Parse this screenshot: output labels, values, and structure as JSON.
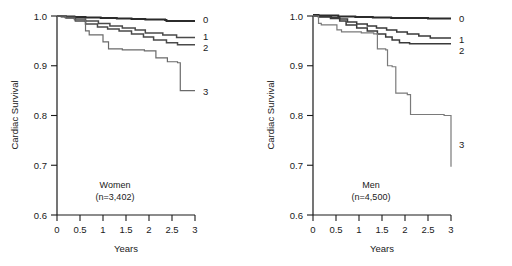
{
  "figure": {
    "title": "",
    "panel_count": 2
  },
  "chart_data": [
    {
      "type": "line",
      "title": "Women",
      "subtitle": "(n=3,402)",
      "xlabel": "Years",
      "ylabel": "Cardiac Survival",
      "xlim": [
        0,
        3
      ],
      "ylim": [
        0.6,
        1.0
      ],
      "xticks": [
        0,
        0.5,
        1,
        1.5,
        2,
        2.5,
        3
      ],
      "xticklabels": [
        "0",
        "0.5",
        "1",
        "1.5",
        "2",
        "2.5",
        "3"
      ],
      "yticks": [
        0.6,
        0.7,
        0.8,
        0.9,
        1.0
      ],
      "yticklabels": [
        "0.6",
        "0.7",
        "0.8",
        "0.9",
        "1.0"
      ],
      "grid": false,
      "legend_position": "right-of-curve-ends",
      "step_type": "post",
      "series": [
        {
          "name": "0",
          "label": "0",
          "color": "#2b2b2b",
          "width": 1.9,
          "x": [
            0.0,
            0.1,
            0.38,
            0.62,
            0.95,
            1.3,
            1.62,
            1.92,
            2.35,
            2.38,
            3.0
          ],
          "y": [
            1.0,
            0.999,
            0.998,
            0.997,
            0.996,
            0.995,
            0.994,
            0.993,
            0.992,
            0.99,
            0.99
          ]
        },
        {
          "name": "1",
          "label": "1",
          "color": "#4a4a4a",
          "width": 1.5,
          "x": [
            0.0,
            0.18,
            0.38,
            0.62,
            0.9,
            1.15,
            1.42,
            1.7,
            1.92,
            2.3,
            2.6,
            3.0
          ],
          "y": [
            1.0,
            0.998,
            0.994,
            0.99,
            0.985,
            0.98,
            0.976,
            0.972,
            0.966,
            0.962,
            0.957,
            0.957
          ]
        },
        {
          "name": "2",
          "label": "2",
          "color": "#4a4a4a",
          "width": 1.5,
          "x": [
            0.0,
            0.2,
            0.4,
            0.62,
            0.88,
            1.1,
            1.35,
            1.62,
            1.88,
            2.1,
            2.38,
            2.62,
            3.0
          ],
          "y": [
            1.0,
            0.996,
            0.99,
            0.984,
            0.978,
            0.974,
            0.97,
            0.964,
            0.958,
            0.952,
            0.946,
            0.942,
            0.942
          ]
        },
        {
          "name": "3",
          "label": "3",
          "color": "#6a6a6a",
          "width": 1.2,
          "x": [
            0.0,
            0.18,
            0.38,
            0.62,
            0.7,
            1.0,
            1.12,
            1.42,
            1.9,
            2.15,
            2.4,
            2.62,
            2.68,
            3.0
          ],
          "y": [
            1.0,
            0.996,
            0.992,
            0.97,
            0.962,
            0.948,
            0.934,
            0.932,
            0.93,
            0.916,
            0.908,
            0.906,
            0.85,
            0.85
          ]
        }
      ]
    },
    {
      "type": "line",
      "title": "Men",
      "subtitle": "(n=4,500)",
      "xlabel": "Years",
      "ylabel": "Cardiac Survival",
      "xlim": [
        0,
        3
      ],
      "ylim": [
        0.6,
        1.0
      ],
      "xticks": [
        0,
        0.5,
        1,
        1.5,
        2,
        2.5,
        3
      ],
      "xticklabels": [
        "0",
        "0.5",
        "1",
        "1.5",
        "2",
        "2.5",
        "3"
      ],
      "yticks": [
        0.6,
        0.7,
        0.8,
        0.9,
        1.0
      ],
      "yticklabels": [
        "0.6",
        "0.7",
        "0.8",
        "0.9",
        "1.0"
      ],
      "grid": false,
      "legend_position": "right-of-curve-ends",
      "step_type": "post",
      "series": [
        {
          "name": "0",
          "label": "0",
          "color": "#2b2b2b",
          "width": 1.9,
          "x": [
            0.0,
            0.12,
            0.55,
            0.92,
            1.3,
            1.7,
            2.1,
            2.5,
            3.0
          ],
          "y": [
            1.002,
            1.001,
            0.999,
            0.998,
            0.997,
            0.996,
            0.996,
            0.995,
            0.995
          ]
        },
        {
          "name": "1",
          "label": "1",
          "color": "#3a3a3a",
          "width": 1.5,
          "x": [
            0.0,
            0.12,
            0.4,
            0.58,
            0.75,
            0.95,
            1.18,
            1.38,
            1.6,
            1.82,
            2.05,
            2.3,
            2.55,
            3.0
          ],
          "y": [
            1.0,
            0.999,
            0.997,
            0.994,
            0.988,
            0.984,
            0.98,
            0.976,
            0.972,
            0.968,
            0.964,
            0.96,
            0.956,
            0.956
          ]
        },
        {
          "name": "2",
          "label": "2",
          "color": "#3a3a3a",
          "width": 1.5,
          "x": [
            0.0,
            0.12,
            0.38,
            0.58,
            0.72,
            0.95,
            1.18,
            1.4,
            1.58,
            1.72,
            1.88,
            2.1,
            3.0
          ],
          "y": [
            1.0,
            0.998,
            0.995,
            0.99,
            0.982,
            0.976,
            0.97,
            0.964,
            0.958,
            0.952,
            0.946,
            0.944,
            0.944
          ]
        },
        {
          "name": "3",
          "label": "3",
          "color": "#7a7a7a",
          "width": 1.2,
          "x": [
            0.0,
            0.12,
            0.18,
            0.52,
            0.62,
            1.05,
            1.32,
            1.4,
            1.58,
            1.62,
            1.72,
            1.8,
            2.05,
            2.12,
            2.85,
            3.0
          ],
          "y": [
            1.0,
            0.985,
            0.982,
            0.972,
            0.968,
            0.966,
            0.964,
            0.934,
            0.932,
            0.9,
            0.898,
            0.845,
            0.842,
            0.802,
            0.8,
            0.697
          ]
        }
      ],
      "annotations": []
    }
  ]
}
